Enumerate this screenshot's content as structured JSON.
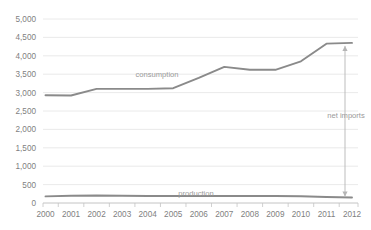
{
  "chart_data": {
    "type": "line",
    "title": "",
    "subtitle": "",
    "xlabel": "",
    "ylabel": "",
    "categories": [
      "2000",
      "2001",
      "2002",
      "2003",
      "2004",
      "2005",
      "2006",
      "2007",
      "2008",
      "2009",
      "2010",
      "2011",
      "2012"
    ],
    "series": [
      {
        "name": "consumption",
        "values": [
          2930,
          2920,
          3100,
          3100,
          3100,
          3120,
          3400,
          3700,
          3620,
          3620,
          3850,
          4330,
          4350
        ],
        "color": "#8a8a8a"
      },
      {
        "name": "production",
        "values": [
          180,
          195,
          205,
          195,
          190,
          190,
          190,
          190,
          190,
          190,
          185,
          165,
          150
        ],
        "color": "#8a8a8a"
      }
    ],
    "ylim": [
      0,
      5000
    ],
    "ytick_values": [
      0,
      500,
      1000,
      1500,
      2000,
      2500,
      3000,
      3500,
      4000,
      4500,
      5000
    ],
    "ytick_labels": [
      "0",
      "500",
      "1,000",
      "1,500",
      "2,000",
      "2,500",
      "3,000",
      "3,500",
      "4,000",
      "4,500",
      "5,000"
    ],
    "grid": true,
    "legend_position": "inline-labels",
    "annotations": [
      {
        "name": "net-imports",
        "text": "net imports",
        "year": "2012",
        "from_value": 150,
        "to_value": 4350,
        "style": "double-headed-vertical-arrow",
        "color": "#b5b5b5"
      }
    ]
  },
  "labels": {
    "consumption": "consumption",
    "production": "production",
    "net_imports": "net imports"
  },
  "colors": {
    "line": "#8a8a8a",
    "grid": "#e4e4e4",
    "axis": "#bdbdbd",
    "text": "#7f7f7f",
    "annotation": "#b5b5b5",
    "background": "#ffffff"
  }
}
